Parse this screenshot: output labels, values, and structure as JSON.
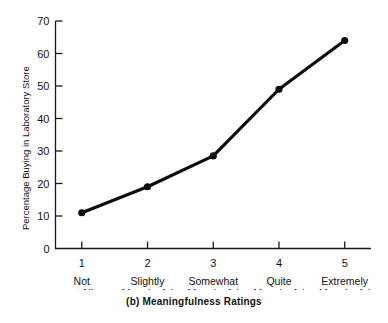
{
  "chart_data": {
    "type": "line",
    "title": "",
    "caption": "(b)  Meaningfulness Ratings",
    "xlabel": "",
    "ylabel": "Percentage Buying in Laboratory Store",
    "categories": [
      "1",
      "2",
      "3",
      "4",
      "5"
    ],
    "category_labels": [
      [
        "Not",
        "at All",
        "Meaningful"
      ],
      [
        "Slightly",
        "Meaningful"
      ],
      [
        "Somewhat",
        "Meaningful"
      ],
      [
        "Quite",
        "Meaningful"
      ],
      [
        "Extremely",
        "Meaningful"
      ]
    ],
    "values": [
      11,
      19,
      28.5,
      49,
      64
    ],
    "ylim": [
      0,
      70
    ],
    "yticks": [
      0,
      10,
      20,
      30,
      40,
      50,
      60,
      70
    ],
    "ytick_labels": [
      "0",
      "10",
      "20",
      "30",
      "40",
      "50",
      "60",
      "70"
    ],
    "xlim": [
      0.6,
      5.4
    ],
    "grid": false,
    "legend": false,
    "legend_position": "none",
    "marker": "filled-circle",
    "line_color": "#0d0d0d",
    "axis_color": "#1a1a1a",
    "background_color": "#ffffff"
  },
  "figure": {
    "caption_text": "(b)  Meaningfulness Ratings"
  }
}
